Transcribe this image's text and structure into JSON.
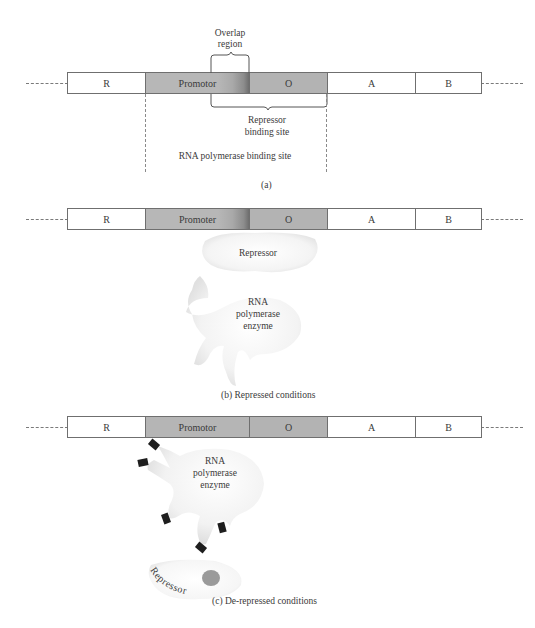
{
  "panels": {
    "a": {
      "segments": [
        {
          "id": "R",
          "label": "R"
        },
        {
          "id": "promoter",
          "label": "Promotor"
        },
        {
          "id": "O",
          "label": "O"
        },
        {
          "id": "A",
          "label": "A"
        },
        {
          "id": "B",
          "label": "B"
        }
      ],
      "overlap_label_line1": "Overlap",
      "overlap_label_line2": "region",
      "repressor_site_line1": "Repressor",
      "repressor_site_line2": "binding site",
      "polymerase_site_label": "RNA polymerase binding site",
      "caption": "(a)"
    },
    "b": {
      "segments": [
        {
          "id": "R",
          "label": "R"
        },
        {
          "id": "promoter",
          "label": "Promoter"
        },
        {
          "id": "O",
          "label": "O"
        },
        {
          "id": "A",
          "label": "A"
        },
        {
          "id": "B",
          "label": "B"
        }
      ],
      "repressor_label": "Repressor",
      "enzyme_line1": "RNA",
      "enzyme_line2": "polymerase",
      "enzyme_line3": "enzyme",
      "caption": "(b)  Repressed conditions"
    },
    "c": {
      "segments": [
        {
          "id": "R",
          "label": "R"
        },
        {
          "id": "promoter",
          "label": "Promotor"
        },
        {
          "id": "O",
          "label": "O"
        },
        {
          "id": "A",
          "label": "A"
        },
        {
          "id": "B",
          "label": "B"
        }
      ],
      "enzyme_line1": "RNA",
      "enzyme_line2": "polymerase",
      "enzyme_line3": "enzyme",
      "repressor_label": "Repressor",
      "caption": "(c) De-repressed conditions"
    }
  },
  "colors": {
    "promoter_fill": "#b5b5b5",
    "operator_fill": "#b3b3b3",
    "gene_fill": "#ffffff",
    "outline": "#6f6f6f",
    "inducer_dot": "#9a9a9a",
    "binding_tab": "#1e1e1e"
  }
}
